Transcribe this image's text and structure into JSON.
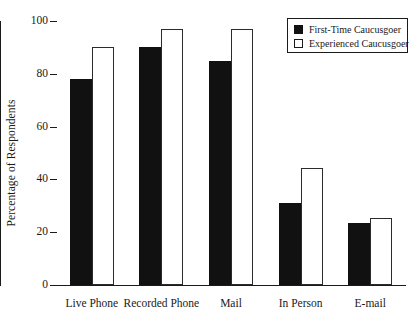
{
  "chart_data": {
    "type": "bar",
    "title": "",
    "subtitle": "",
    "xlabel": "",
    "ylabel": "Percentage of Respondents",
    "categories": [
      "Live Phone",
      "Recorded Phone",
      "Mail",
      "In Person",
      "E-mail"
    ],
    "series": [
      {
        "name": "First-Time Caucusgoer",
        "swatch": "filled",
        "color": "#111111",
        "values": [
          78,
          90,
          85,
          31,
          23.5
        ]
      },
      {
        "name": "Experienced Caucusgoer",
        "swatch": "hollow",
        "color": "#ffffff",
        "values": [
          90,
          97,
          97,
          44.5,
          25.5
        ]
      }
    ],
    "ylim": [
      0,
      100
    ],
    "yticks": [
      0,
      20,
      40,
      60,
      80,
      100
    ],
    "ytick_labels": [
      "0",
      "20",
      "40",
      "60",
      "80",
      "100"
    ],
    "grid": false,
    "legend_position": "top-right"
  },
  "legend": {
    "items": [
      {
        "label": "First-Time Caucusgoer"
      },
      {
        "label": "Experienced Caucusgoer"
      }
    ]
  },
  "colors": {
    "axis": "#1a1a1a",
    "series_first_time": "#111111",
    "series_experienced": "#ffffff",
    "background": "#ffffff"
  }
}
